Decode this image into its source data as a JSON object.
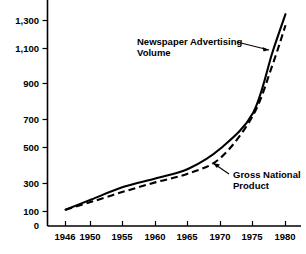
{
  "chart_data": {
    "type": "line",
    "title": "",
    "subtitle": "",
    "xlabel": "",
    "ylabel": "",
    "xlim": [
      1946,
      1981
    ],
    "ylim": [
      0,
      1400
    ],
    "grid": false,
    "legend_position": "inline-annotations",
    "x_tick_labels": [
      "1946",
      "1950",
      "1955",
      "1960",
      "1965",
      "1970",
      "1975",
      "1980"
    ],
    "x_tick_values": [
      1946,
      1950,
      1955,
      1960,
      1965,
      1970,
      1975,
      1980
    ],
    "y_tick_labels": [
      "0",
      "100",
      "300",
      "500",
      "700",
      "900",
      "1,100",
      "1,300"
    ],
    "y_tick_values": [
      0,
      100,
      300,
      500,
      700,
      900,
      1100,
      1300
    ],
    "series": [
      {
        "name": "Newspaper Advertising Volume",
        "style": "solid",
        "x": [
          1946,
          1950,
          1955,
          1960,
          1965,
          1970,
          1975,
          1978,
          1980
        ],
        "values": [
          100,
          165,
          245,
          300,
          360,
          490,
          715,
          1100,
          1340
        ]
      },
      {
        "name": "Gross National Product",
        "style": "dashed",
        "x": [
          1946,
          1950,
          1955,
          1960,
          1965,
          1970,
          1975,
          1978,
          1980
        ],
        "values": [
          100,
          150,
          215,
          275,
          330,
          430,
          700,
          1020,
          1270
        ]
      }
    ],
    "annotations": [
      {
        "id": "newspaper-advertising-volume",
        "line1": "Newspaper Advertising",
        "line2": "Volume",
        "points_to_series": "Newspaper Advertising Volume"
      },
      {
        "id": "gross-national-product",
        "line1": "Gross National",
        "line2": "Product",
        "points_to_series": "Gross National Product"
      }
    ],
    "colors": {
      "axis": "#000000",
      "series_solid": "#000000",
      "series_dashed": "#000000",
      "background": "#ffffff"
    }
  }
}
